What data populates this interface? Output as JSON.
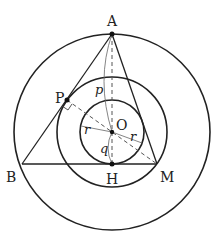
{
  "diagram": {
    "title": "",
    "colors": {
      "stroke": "#222222",
      "dashed": "#555555",
      "thin": "#666666",
      "background": "#ffffff"
    },
    "points": {
      "A": {
        "label": "A",
        "x": 112,
        "y": 34
      },
      "B": {
        "label": "B",
        "x": 22,
        "y": 164
      },
      "M": {
        "label": "M",
        "x": 157,
        "y": 164
      },
      "H": {
        "label": "H",
        "x": 112,
        "y": 164
      },
      "O": {
        "label": "O",
        "x": 112,
        "y": 132
      },
      "P": {
        "label": "P",
        "x": 67,
        "y": 100
      }
    },
    "circles": [
      {
        "name": "outer",
        "cx": 112,
        "cy": 132,
        "r": 98
      },
      {
        "name": "middle",
        "cx": 112,
        "cy": 132,
        "r": 55
      },
      {
        "name": "inner",
        "cx": 112,
        "cy": 132,
        "r": 32
      }
    ],
    "segment_labels": {
      "p": "p",
      "q": "q",
      "r_left": "r",
      "r_right": "r"
    }
  }
}
